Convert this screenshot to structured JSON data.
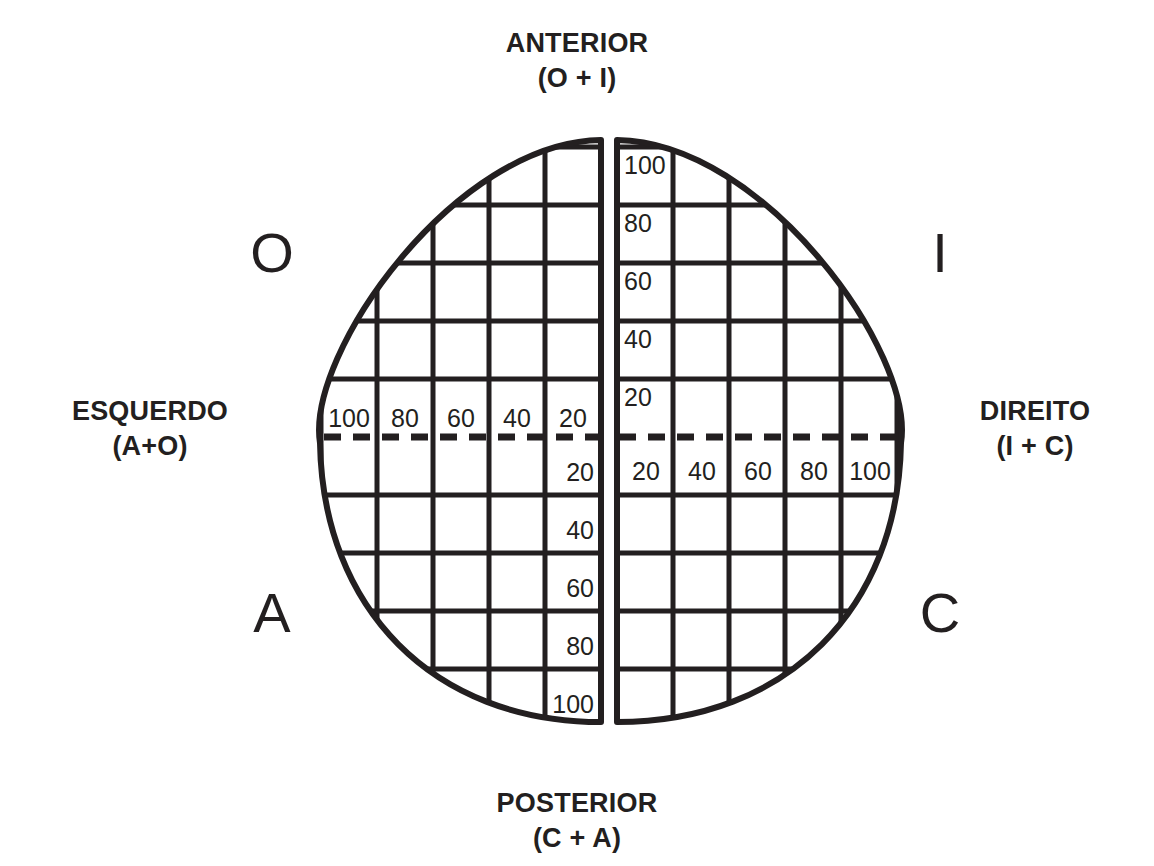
{
  "axes": {
    "top": {
      "name": "ANTERIOR",
      "formula": "(O + I)"
    },
    "bottom": {
      "name": "POSTERIOR",
      "formula": "(C + A)"
    },
    "left": {
      "name": "ESQUERDO",
      "formula": "(A+O)"
    },
    "right": {
      "name": "DIREITO",
      "formula": "(I + C)"
    }
  },
  "quadrants": {
    "top_left": "O",
    "top_right": "I",
    "bottom_left": "A",
    "bottom_right": "C"
  },
  "scales": {
    "vertical_upper": [
      "100",
      "80",
      "60",
      "40",
      "20"
    ],
    "vertical_lower": [
      "20",
      "40",
      "60",
      "80",
      "100"
    ],
    "horizontal_left": [
      "100",
      "80",
      "60",
      "40",
      "20"
    ],
    "horizontal_right": [
      "20",
      "40",
      "60",
      "80",
      "100"
    ]
  },
  "geometry": {
    "left_half": {
      "x_start": 320,
      "x_end": 601
    },
    "right_half": {
      "x_start": 617,
      "x_end": 901
    },
    "y_top": 140,
    "y_bottom": 722,
    "y_midline": 437,
    "cell_width": 56,
    "cell_height": 58
  },
  "colors": {
    "ink": "#231f20",
    "background": "#ffffff"
  }
}
